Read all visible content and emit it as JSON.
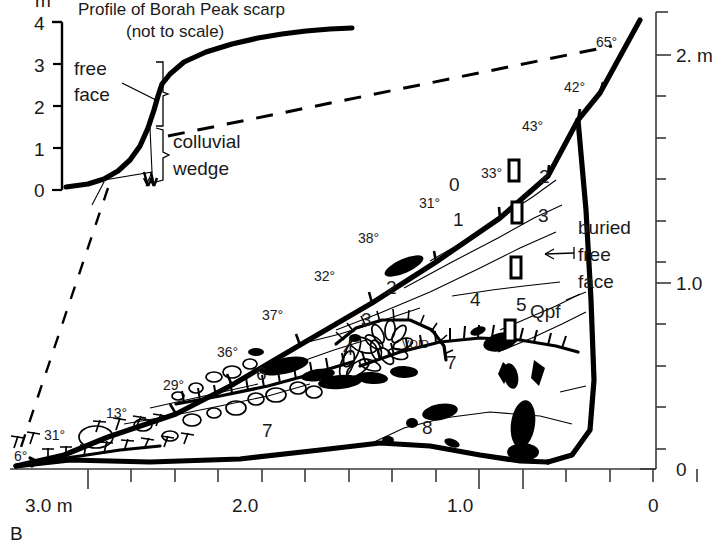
{
  "figure": {
    "panel_label": "B",
    "inset": {
      "title_line1": "Profile of Borah Peak scarp",
      "title_line2": "(not to scale)",
      "y_axis_unit": "m",
      "y_ticks": [
        "4",
        "3",
        "2",
        "1",
        "0"
      ],
      "labels": {
        "free_face_line1": "free",
        "free_face_line2": "face",
        "colluvial_line1": "colluvial",
        "colluvial_line2": "wedge"
      }
    },
    "right_axis": {
      "label_top": "2. m",
      "label_mid": "1.0",
      "label_bottom": "0",
      "tick_count": 11,
      "range": [
        0,
        2.2
      ]
    },
    "bottom_axis": {
      "labels": [
        "3.0 m",
        "2.0",
        "1.0",
        "0"
      ],
      "range": [
        0,
        3.2
      ]
    },
    "annotations": {
      "buried_free_face_line1": "buried",
      "buried_free_face_line2": "free",
      "buried_free_face_line3": "face",
      "void": "VOID",
      "qpf": "Qpf"
    },
    "dip_angles": [
      {
        "label": "6°",
        "x": 14,
        "y": 461
      },
      {
        "label": "31°",
        "x": 44,
        "y": 440
      },
      {
        "label": "13°",
        "x": 106,
        "y": 418
      },
      {
        "label": "29°",
        "x": 163,
        "y": 390
      },
      {
        "label": "36°",
        "x": 217,
        "y": 357
      },
      {
        "label": "37°",
        "x": 262,
        "y": 320
      },
      {
        "label": "32°",
        "x": 314,
        "y": 281
      },
      {
        "label": "38°",
        "x": 358,
        "y": 243
      },
      {
        "label": "31°",
        "x": 419,
        "y": 208
      },
      {
        "label": "33°",
        "x": 481,
        "y": 178
      },
      {
        "label": "43°",
        "x": 522,
        "y": 131
      },
      {
        "label": "42°",
        "x": 564,
        "y": 92
      },
      {
        "label": "65°",
        "x": 596,
        "y": 47
      }
    ],
    "stratigraphic_units": [
      {
        "label": "0",
        "x": 449,
        "y": 191
      },
      {
        "label": "1",
        "x": 453,
        "y": 226
      },
      {
        "label": "2",
        "x": 539,
        "y": 183
      },
      {
        "label": "3",
        "x": 538,
        "y": 222
      },
      {
        "label": "2",
        "x": 386,
        "y": 294
      },
      {
        "label": "3",
        "x": 361,
        "y": 326
      },
      {
        "label": "4",
        "x": 343,
        "y": 355
      },
      {
        "label": "4",
        "x": 470,
        "y": 306
      },
      {
        "label": "5",
        "x": 516,
        "y": 311
      },
      {
        "label": "6",
        "x": 256,
        "y": 380
      },
      {
        "label": "7",
        "x": 262,
        "y": 437
      },
      {
        "label": "7",
        "x": 446,
        "y": 369
      },
      {
        "label": "8",
        "x": 422,
        "y": 434
      }
    ],
    "sample_boxes": [
      {
        "x": 514,
        "y": 170
      },
      {
        "x": 517,
        "y": 212
      },
      {
        "x": 516,
        "y": 267
      },
      {
        "x": 510,
        "y": 330
      }
    ]
  }
}
